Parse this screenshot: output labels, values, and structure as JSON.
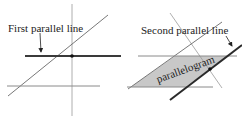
{
  "left_panel": {
    "label": "First parallel line"
  },
  "right_panel": {
    "label": "Second parallel line",
    "shape_label": "parallelogram"
  },
  "colors": {
    "thin_line": "#8a8a8a",
    "thick_line": "#2a2a2a",
    "fill": "#c8c8c8",
    "dot": "#111111"
  }
}
